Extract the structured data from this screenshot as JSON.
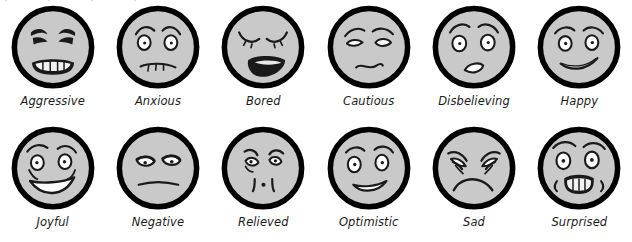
{
  "page": {
    "background_color": "#ffffff",
    "columns": 6,
    "rows": 2,
    "ghost_top_artifact": "·     ·   ·     ·"
  },
  "style": {
    "face_fill": "#c9c9c9",
    "face_outline": "#000000",
    "feature_stroke": "#1a1a1a",
    "eye_white": "#ffffff",
    "teeth_white": "#f2f2f2",
    "label_color": "#1b1b1b"
  },
  "faces": [
    {
      "id": "aggressive",
      "label": "Aggressive",
      "row": 1,
      "col": 1,
      "eyes": "angry-slanted-narrow",
      "brows": "furrowed-down",
      "mouth": "grimace-with-teeth"
    },
    {
      "id": "anxious",
      "label": "Anxious",
      "row": 1,
      "col": 2,
      "eyes": "round-with-pupils",
      "brows": "worried-raised-inner",
      "mouth": "wavy-stitched"
    },
    {
      "id": "bored",
      "label": "Bored",
      "row": 1,
      "col": 3,
      "eyes": "closed-arcs-with-lashes",
      "brows": "none",
      "mouth": "wide-open-yawn-filled"
    },
    {
      "id": "cautious",
      "label": "Cautious",
      "row": 1,
      "col": 4,
      "eyes": "narrow-almond-blank",
      "brows": "slanted-up-outer",
      "mouth": "squiggly-uncertain"
    },
    {
      "id": "disbelieving",
      "label": "Disbelieving",
      "row": 1,
      "col": 5,
      "eyes": "wide-round-dot-pupils",
      "brows": "high-arched",
      "mouth": "small-open-oval"
    },
    {
      "id": "happy",
      "label": "Happy",
      "row": 1,
      "col": 6,
      "eyes": "round-with-pupils",
      "brows": "raised-arcs",
      "mouth": "crooked-smile-line"
    },
    {
      "id": "joyful",
      "label": "Joyful",
      "row": 2,
      "col": 1,
      "eyes": "smiling-with-pupils",
      "brows": "high-arched",
      "mouth": "big-open-grin-teeth"
    },
    {
      "id": "negative",
      "label": "Negative",
      "row": 2,
      "col": 2,
      "eyes": "half-lidded-suspicious",
      "brows": "none",
      "mouth": "flat-straight-line"
    },
    {
      "id": "relieved",
      "label": "Relieved",
      "row": 2,
      "col": 3,
      "eyes": "small-round-with-brows",
      "brows": "short-slanted",
      "mouth": "small-pursed-dot"
    },
    {
      "id": "optimistic",
      "label": "Optimistic",
      "row": 2,
      "col": 4,
      "eyes": "round-with-pupils",
      "brows": "raised-arcs",
      "mouth": "open-smile-outline"
    },
    {
      "id": "sad",
      "label": "Sad",
      "row": 2,
      "col": 5,
      "eyes": "droopy-crinkled",
      "brows": "sloping-down-outer",
      "mouth": "deep-frown-curve"
    },
    {
      "id": "surprised",
      "label": "Surprised",
      "row": 2,
      "col": 6,
      "eyes": "wide-startled-pupils",
      "brows": "high-raised",
      "mouth": "open-rect-teeth-shaking"
    }
  ]
}
